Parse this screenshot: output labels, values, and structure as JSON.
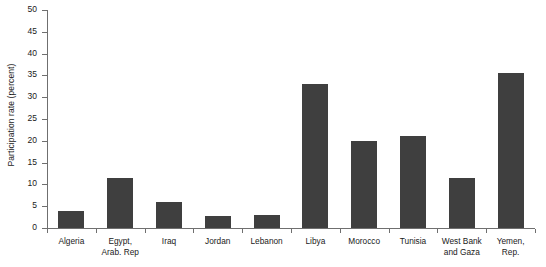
{
  "chart_data": {
    "type": "bar",
    "title": "",
    "subtitle": "",
    "xlabel": "",
    "ylabel": "Participation rate (percent)",
    "ylim": [
      0,
      50
    ],
    "ytick_labels": [
      "50",
      "45",
      "40",
      "35",
      "30",
      "25",
      "20",
      "15",
      "10",
      "5",
      "0"
    ],
    "ytick_values": [
      50,
      45,
      40,
      35,
      30,
      25,
      20,
      15,
      10,
      5,
      0
    ],
    "grid": false,
    "legend": false,
    "legend_position": "none",
    "bar_color": "#3f3f3f",
    "axis_color": "#6f6f6f",
    "background": "#ffffff",
    "categories": [
      "Algeria",
      "Egypt, Arab. Rep",
      "Iraq",
      "Jordan",
      "Lebanon",
      "Libya",
      "Morocco",
      "Tunisia",
      "West Bank and Gaza",
      "Yemen, Rep."
    ],
    "category_lines": [
      [
        "Algeria"
      ],
      [
        "Egypt,",
        "Arab. Rep"
      ],
      [
        "Iraq"
      ],
      [
        "Jordan"
      ],
      [
        "Lebanon"
      ],
      [
        "Libya"
      ],
      [
        "Morocco"
      ],
      [
        "Tunisia"
      ],
      [
        "West Bank",
        "and Gaza"
      ],
      [
        "Yemen,",
        "Rep."
      ]
    ],
    "values": [
      4,
      11.5,
      6,
      2.8,
      3,
      33,
      20,
      21,
      11.5,
      35.5
    ]
  }
}
